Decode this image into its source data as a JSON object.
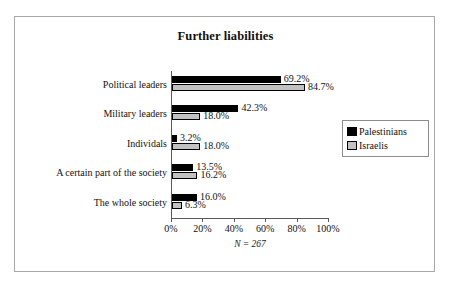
{
  "figure": {
    "n_caption": "N = 267"
  },
  "legend": {
    "items": [
      {
        "label": "Palestinians",
        "swatch": "black-swatch-icon",
        "color": "#000000"
      },
      {
        "label": "Israelis",
        "swatch": "gray-swatch-icon",
        "color": "#c2c2c2"
      }
    ]
  },
  "chart_data": {
    "type": "bar",
    "orientation": "horizontal",
    "title": "Further liabilities",
    "xlabel": "",
    "ylabel": "",
    "xlim": [
      0,
      100
    ],
    "xticks": [
      "0%",
      "20%",
      "40%",
      "60%",
      "80%",
      "100%"
    ],
    "xtick_values": [
      0,
      20,
      40,
      60,
      80,
      100
    ],
    "grid": false,
    "legend_position": "right",
    "categories": [
      "Political leaders",
      "Military leaders",
      "Individals",
      "A certain part of the society",
      "The whole society"
    ],
    "series": [
      {
        "name": "Palestinians",
        "color": "#000000",
        "values": [
          69.2,
          42.3,
          3.2,
          13.5,
          16.0
        ],
        "labels": [
          "69.2%",
          "42.3%",
          "3.2%",
          "13.5%",
          "16.0%"
        ]
      },
      {
        "name": "Israelis",
        "color": "#c2c2c2",
        "values": [
          84.7,
          18.0,
          18.0,
          16.2,
          6.3
        ],
        "labels": [
          "84.7%",
          "18.0%",
          "18.0%",
          "16.2%",
          "6.3%"
        ]
      }
    ],
    "annotations": [
      "N = 267"
    ]
  }
}
